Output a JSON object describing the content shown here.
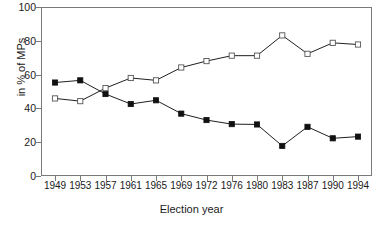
{
  "chart_data": {
    "type": "line",
    "title": "",
    "xlabel": "Election year",
    "ylabel": "in % of MPs",
    "categories": [
      "1949",
      "1953",
      "1957",
      "1961",
      "1965",
      "1969",
      "1972",
      "1976",
      "1980",
      "1983",
      "1987",
      "1990",
      "1994"
    ],
    "ylim": [
      0,
      100
    ],
    "yticks": [
      0,
      20,
      40,
      60,
      80,
      100
    ],
    "ytick_labels": [
      "0",
      "20",
      "40",
      "60",
      "80",
      "100"
    ],
    "grid": false,
    "legend": "none",
    "series": [
      {
        "name": "filled-squares",
        "marker": "filled-square",
        "values": [
          55.3,
          56.6,
          48.5,
          42.6,
          44.8,
          36.9,
          33.1,
          30.7,
          30.5,
          17.8,
          29.1,
          22.3,
          23.3
        ]
      },
      {
        "name": "open-squares",
        "marker": "open-square",
        "values": [
          45.9,
          44.3,
          52.0,
          58.0,
          56.6,
          64.2,
          68.0,
          71.2,
          71.2,
          83.2,
          72.3,
          78.8,
          77.8
        ]
      }
    ]
  },
  "axes": {
    "y_label_text": "in % of MPs",
    "x_label_text": "Election year"
  },
  "colors": {
    "frame": "#7a7a7a",
    "line": "#1f1f1f",
    "marker_filled": "#111111",
    "marker_open_fill": "#ffffff",
    "marker_open_stroke": "#555555",
    "background": "#ffffff"
  }
}
